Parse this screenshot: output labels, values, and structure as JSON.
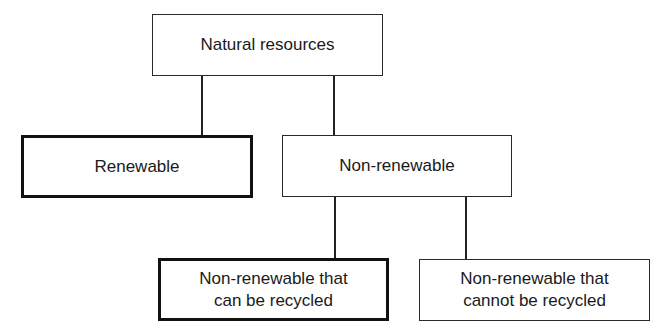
{
  "diagram": {
    "type": "hierarchy-tree",
    "nodes": {
      "root": {
        "label": "Natural resources",
        "emphasis": "normal"
      },
      "renewable": {
        "label": "Renewable",
        "emphasis": "bold-border"
      },
      "non_renewable": {
        "label": "Non-renewable",
        "emphasis": "normal"
      },
      "recyclable": {
        "label_line1": "Non-renewable that",
        "label_line2": "can be recycled",
        "emphasis": "bold-border"
      },
      "non_recyclable": {
        "label_line1": "Non-renewable that",
        "label_line2": "cannot be recycled",
        "emphasis": "normal"
      }
    },
    "edges": [
      {
        "from": "Natural resources",
        "to": "Renewable"
      },
      {
        "from": "Natural resources",
        "to": "Non-renewable"
      },
      {
        "from": "Non-renewable",
        "to": "Non-renewable that can be recycled"
      },
      {
        "from": "Non-renewable",
        "to": "Non-renewable that cannot be recycled"
      }
    ],
    "colors": {
      "line": "#222222",
      "text": "#1a1a1a",
      "background": "#ffffff"
    }
  }
}
